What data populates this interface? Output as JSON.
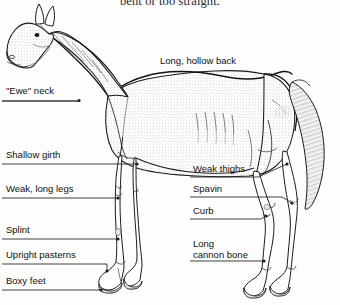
{
  "figure": {
    "clipped_caption_above": "bent or too straight.",
    "background_color": "#fdfdfc",
    "ink_color": "#1a1a1a",
    "leader_line_color": "#2b2b2b"
  },
  "subject": {
    "name": "horse-side-profile",
    "orientation": "left-facing head, full body side view"
  },
  "callouts": {
    "top_back": {
      "label": "Long, hollow back",
      "x": 160,
      "y": 56,
      "has_leader": false
    },
    "ewe_neck": {
      "label": "\"Ewe\" neck",
      "x": 6,
      "y": 86,
      "has_leader": true
    },
    "shallow_girth": {
      "label": "Shallow girth",
      "x": 6,
      "y": 150,
      "has_leader": true
    },
    "weak_long_legs": {
      "label": "Weak, long legs",
      "x": 6,
      "y": 184,
      "has_leader": true
    },
    "splint": {
      "label": "Splint",
      "x": 6,
      "y": 225,
      "has_leader": true
    },
    "upright_pasterns": {
      "label": "Upright pasterns",
      "x": 6,
      "y": 250,
      "has_leader": true
    },
    "boxy_feet": {
      "label": "Boxy feet",
      "x": 6,
      "y": 276,
      "has_leader": true
    },
    "weak_thighs": {
      "label": "Weak thighs",
      "x": 193,
      "y": 164,
      "has_leader": true
    },
    "spavin": {
      "label": "Spavin",
      "x": 193,
      "y": 184,
      "has_leader": true
    },
    "curb": {
      "label": "Curb",
      "x": 193,
      "y": 206,
      "has_leader": true
    },
    "long_cannon_bone_line1": {
      "label": "Long",
      "x": 193,
      "y": 239,
      "has_leader": false
    },
    "long_cannon_bone_line2": {
      "label": "cannon bone",
      "x": 193,
      "y": 250,
      "has_leader": true
    }
  }
}
